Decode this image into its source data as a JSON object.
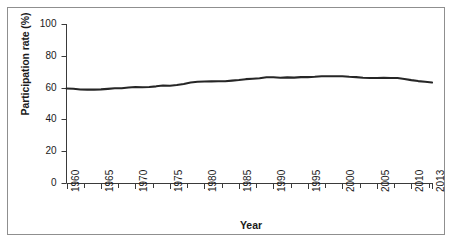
{
  "chart_data": {
    "type": "line",
    "title": "",
    "subtitle": "",
    "xlabel": "Year",
    "ylabel": "Participation rate (%)",
    "xlim": [
      1960,
      2013
    ],
    "ylim": [
      0,
      100
    ],
    "grid": false,
    "legend": "none",
    "line_color": "#262626",
    "x_tick_labels": [
      "1960",
      "1965",
      "1970",
      "1975",
      "1980",
      "1985",
      "1990",
      "1995",
      "2000",
      "2005",
      "2010",
      "2013"
    ],
    "x_tick_values": [
      1960,
      1965,
      1970,
      1975,
      1980,
      1985,
      1990,
      1995,
      2000,
      2005,
      2010,
      2013
    ],
    "x_minor_tick_interval": 2.5,
    "y_tick_labels": [
      "0",
      "20",
      "40",
      "60",
      "80",
      "100"
    ],
    "y_tick_values": [
      0,
      20,
      40,
      60,
      80,
      100
    ],
    "series": [
      {
        "name": "Participation rate",
        "x": [
          1960,
          1961,
          1962,
          1963,
          1964,
          1965,
          1966,
          1967,
          1968,
          1969,
          1970,
          1971,
          1972,
          1973,
          1974,
          1975,
          1976,
          1977,
          1978,
          1979,
          1980,
          1981,
          1982,
          1983,
          1984,
          1985,
          1986,
          1987,
          1988,
          1989,
          1990,
          1991,
          1992,
          1993,
          1994,
          1995,
          1996,
          1997,
          1998,
          1999,
          2000,
          2001,
          2002,
          2003,
          2004,
          2005,
          2006,
          2007,
          2008,
          2009,
          2010,
          2011,
          2012,
          2013
        ],
        "values": [
          59.4,
          59.3,
          58.8,
          58.7,
          58.7,
          58.9,
          59.2,
          59.6,
          59.6,
          60.1,
          60.4,
          60.2,
          60.4,
          60.8,
          61.3,
          61.2,
          61.6,
          62.3,
          63.2,
          63.7,
          63.8,
          63.9,
          64.0,
          64.0,
          64.4,
          64.8,
          65.3,
          65.6,
          65.9,
          66.5,
          66.5,
          66.2,
          66.4,
          66.3,
          66.6,
          66.6,
          66.8,
          67.1,
          67.1,
          67.1,
          67.1,
          66.8,
          66.6,
          66.2,
          66.0,
          66.0,
          66.2,
          66.0,
          66.0,
          65.4,
          64.7,
          64.1,
          63.7,
          63.2
        ]
      }
    ]
  }
}
